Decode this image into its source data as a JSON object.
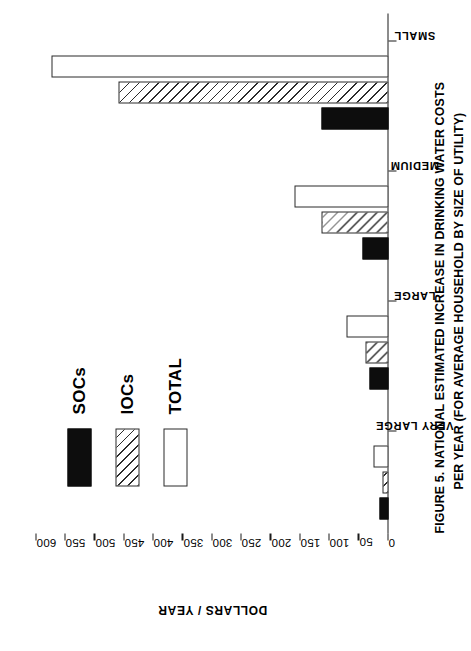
{
  "figure": {
    "caption_line1": "FIGURE 5.  NATIONAL ESTIMATED INCREASE IN DRINKING WATER COSTS",
    "caption_line2": "PER YEAR (FOR AVERAGE HOUSEHOLD BY SIZE OF UTILITY)"
  },
  "legend": {
    "items": [
      {
        "label": "SOCs",
        "swatch": "solid-black-swatch"
      },
      {
        "label": "IOCs",
        "swatch": "diagonal-hatch-swatch"
      },
      {
        "label": "TOTAL",
        "swatch": "white-outline-swatch"
      }
    ]
  },
  "chart_data": {
    "type": "bar",
    "title": "FIGURE 5.  NATIONAL ESTIMATED INCREASE IN DRINKING WATER COSTS PER YEAR (FOR AVERAGE HOUSEHOLD BY SIZE OF UTILITY)",
    "orientation": "vertical-bars-rotated-90ccw",
    "xlabel": "",
    "ylabel": "DOLLARS / YEAR",
    "ylim": [
      0,
      600
    ],
    "ytick_step": 50,
    "ytick_labels": [
      "0",
      "50",
      "100",
      "150",
      "200",
      "250",
      "300",
      "350",
      "400",
      "450",
      "500",
      "550",
      "600"
    ],
    "ytick_values": [
      0,
      50,
      100,
      150,
      200,
      250,
      300,
      350,
      400,
      450,
      500,
      550,
      600
    ],
    "grid": false,
    "legend_position": "upper-left-inside",
    "categories": [
      "VERY LARGE",
      "LARGE",
      "MEDIUM",
      "SMALL"
    ],
    "series": [
      {
        "name": "SOCs",
        "values": [
          15,
          32,
          45,
          115
        ]
      },
      {
        "name": "IOCs",
        "values": [
          10,
          40,
          115,
          460
        ]
      },
      {
        "name": "TOTAL",
        "values": [
          25,
          72,
          160,
          575
        ]
      }
    ]
  }
}
